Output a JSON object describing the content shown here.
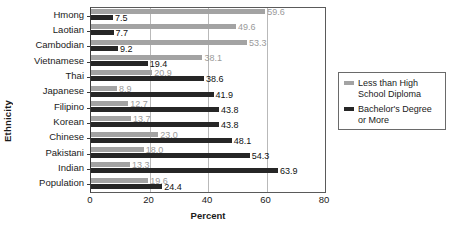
{
  "chart_data": {
    "type": "bar",
    "orientation": "horizontal",
    "title": "",
    "xlabel": "Percent",
    "ylabel": "Ethnicity",
    "xlim": [
      0,
      80
    ],
    "xticks": [
      0,
      20,
      40,
      60,
      80
    ],
    "grid": true,
    "legend_position": "right",
    "categories": [
      "Hmong",
      "Laotian",
      "Cambodian",
      "Vietnamese",
      "Thai",
      "Japanese",
      "Filipino",
      "Korean",
      "Chinese",
      "Pakistani",
      "Indian",
      "Population"
    ],
    "series": [
      {
        "name": "Less than High School Diploma",
        "color": "#a3a3a3",
        "values": [
          59.6,
          49.6,
          53.3,
          38.1,
          20.9,
          8.9,
          12.7,
          13.7,
          23.0,
          18.0,
          13.3,
          19.6
        ]
      },
      {
        "name": "Bachelor's Degree or More",
        "color": "#262626",
        "values": [
          7.5,
          7.7,
          9.2,
          19.4,
          38.6,
          41.9,
          43.8,
          43.8,
          48.1,
          54.3,
          63.9,
          24.4
        ]
      }
    ]
  },
  "legend": {
    "items": [
      {
        "label": "Less than High School Diploma",
        "swatch": "light"
      },
      {
        "label": "Bachelor's Degree or More",
        "swatch": "dark"
      }
    ]
  }
}
